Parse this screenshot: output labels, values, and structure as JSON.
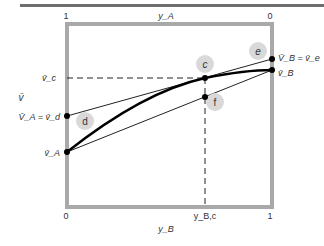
{
  "diagram": {
    "type": "partial-molar-volume-tangent-construction",
    "colors": {
      "frame": "#a9a9a9",
      "top_rule": "#6e6e6e",
      "curve": "#000000",
      "tangent": "#222222",
      "marker_fill": "#d9d9d9",
      "text": "#333333"
    },
    "top_axis": {
      "label": "y_A",
      "left_tick": "1",
      "right_tick": "0"
    },
    "bottom_axis": {
      "label": "y_B",
      "left_tick": "0",
      "right_tick": "1",
      "marked_value": "y_B,c"
    },
    "y_axis": {
      "label": "v̄"
    },
    "left_labels": {
      "v_c": "v̄_c",
      "VA_eq_vd": "V̄_A = v̄_d",
      "vA": "v̄_A"
    },
    "right_labels": {
      "VB_eq_ve": "V̄_B = v̄_e",
      "vB": "v̄_B"
    },
    "points": [
      {
        "name": "c",
        "label": "c"
      },
      {
        "name": "d",
        "label": "d"
      },
      {
        "name": "e",
        "label": "e"
      },
      {
        "name": "f",
        "label": "f"
      }
    ]
  }
}
